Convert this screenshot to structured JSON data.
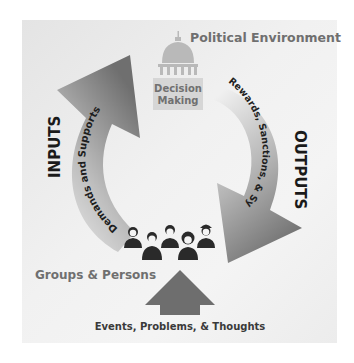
{
  "diagram": {
    "title": "Political Environment",
    "center": {
      "label_line1": "Decision",
      "label_line2": "Making",
      "icon": "capitol-building-icon"
    },
    "inputs": {
      "label": "INPUTS",
      "arc_text": "Demands and Supports"
    },
    "outputs": {
      "label": "OUTPUTS",
      "arc_text": "Rewards, Sanctions, & Symbols"
    },
    "groups": {
      "label": "Groups & Persons",
      "icon": "people-group-icon",
      "people_count": 5
    },
    "bottom": {
      "label": "Events, Problems, & Thoughts",
      "icon": "up-arrow-icon"
    },
    "colors": {
      "panel_bg": "#efefef",
      "arrow_dark": "#7a7a7a",
      "arrow_light": "#e6e6e6",
      "title_text": "#6f6f6f",
      "center_icon": "#b9b9b9",
      "center_label_bg": "#d6d6d6",
      "center_label_text": "#707070",
      "dark_text": "#1a1a1a",
      "bottom_arrow": "#6e6e6e",
      "people": "#2a2a2a"
    }
  }
}
